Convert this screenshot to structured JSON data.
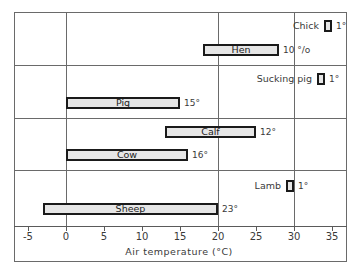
{
  "chart_data": {
    "type": "bar",
    "subtype": "floating-range-horizontal",
    "title": "",
    "xlabel": "Air temperature  (°C)",
    "ylabel": "",
    "xlim": [
      -5.5,
      36.5
    ],
    "xticks": [
      -5,
      0,
      5,
      10,
      15,
      20,
      25,
      30,
      35
    ],
    "xtick_labels": [
      "-5",
      "0",
      "5",
      "10",
      "15",
      "20",
      "25",
      "30",
      "35"
    ],
    "grid": {
      "vertical_at": [
        0,
        20,
        30
      ],
      "horizontal_panel_dividers": true
    },
    "legend": null,
    "panels": [
      {
        "group": "Poultry",
        "bars": [
          "Chick",
          "Hen"
        ]
      },
      {
        "group": "Pigs",
        "bars": [
          "Sucking pig",
          "Pig"
        ]
      },
      {
        "group": "Cattle",
        "bars": [
          "Calf",
          "Cow"
        ]
      },
      {
        "group": "Sheep",
        "bars": [
          "Lamb",
          "Sheep"
        ]
      }
    ],
    "series": [
      {
        "name": "Chick",
        "min": 34,
        "max": 35,
        "range_label": "1°",
        "label_position": "outside-left"
      },
      {
        "name": "Hen",
        "min": 18,
        "max": 28,
        "range_label": "10 °/o",
        "label_position": "inside"
      },
      {
        "name": "Sucking pig",
        "min": 33,
        "max": 34,
        "range_label": "1°",
        "label_position": "outside-left"
      },
      {
        "name": "Pig",
        "min": 0,
        "max": 15,
        "range_label": "15°",
        "label_position": "inside"
      },
      {
        "name": "Calf",
        "min": 13,
        "max": 25,
        "range_label": "12°",
        "label_position": "inside"
      },
      {
        "name": "Cow",
        "min": 0,
        "max": 16,
        "range_label": "16°",
        "label_position": "inside"
      },
      {
        "name": "Lamb",
        "min": 29,
        "max": 30,
        "range_label": "1°",
        "label_position": "outside-left"
      },
      {
        "name": "Sheep",
        "min": -3,
        "max": 20,
        "range_label": "23°",
        "label_position": "inside"
      }
    ]
  },
  "colors": {
    "bar_fill": "#e6e6e6",
    "bar_border": "#1a1a1a",
    "grid": "#6a6a6a",
    "text": "#3a3a3a"
  }
}
